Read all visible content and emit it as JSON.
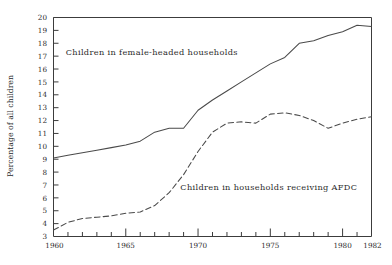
{
  "chart_data": {
    "type": "line",
    "title": "",
    "subtitle": "",
    "xlabel": "",
    "ylabel": "Percentage of all children",
    "xlim": [
      1960,
      1982
    ],
    "ylim": [
      3,
      20
    ],
    "grid": false,
    "legend_position": "inline-annotation",
    "x_tick_labels": [
      "1960",
      "1965",
      "1970",
      "1975",
      "1980",
      "1982"
    ],
    "x_tick_values": [
      1960,
      1965,
      1970,
      1975,
      1980,
      1982
    ],
    "x_minor_tick_values": [
      1961,
      1962,
      1963,
      1964,
      1966,
      1967,
      1968,
      1969,
      1971,
      1972,
      1973,
      1974,
      1976,
      1977,
      1978,
      1979,
      1981
    ],
    "y_tick_labels": [
      "3",
      "4",
      "5",
      "6",
      "7",
      "8",
      "9",
      "10",
      "11",
      "12",
      "13",
      "14",
      "15",
      "16",
      "17",
      "18",
      "19",
      "20"
    ],
    "y_tick_values": [
      3,
      4,
      5,
      6,
      7,
      8,
      9,
      10,
      11,
      12,
      13,
      14,
      15,
      16,
      17,
      18,
      19,
      20
    ],
    "x": [
      1960,
      1961,
      1962,
      1963,
      1964,
      1965,
      1966,
      1967,
      1968,
      1969,
      1970,
      1971,
      1972,
      1973,
      1974,
      1975,
      1976,
      1977,
      1978,
      1979,
      1980,
      1981,
      1982
    ],
    "series": [
      {
        "name": "Children in female-headed households",
        "style": "solid",
        "color": "#4a4a4a",
        "annotation": "Children in female-headed households",
        "values": [
          9.1,
          9.3,
          9.5,
          9.7,
          9.9,
          10.1,
          10.4,
          11.1,
          11.4,
          11.4,
          12.8,
          13.6,
          14.3,
          15.0,
          15.7,
          16.4,
          16.9,
          18.0,
          18.2,
          18.6,
          18.9,
          19.4,
          19.3
        ]
      },
      {
        "name": "Children in households receiving AFDC",
        "style": "dashed",
        "color": "#4a4a4a",
        "annotation": "Children in households receiving AFDC",
        "values": [
          3.5,
          4.1,
          4.4,
          4.5,
          4.6,
          4.8,
          4.9,
          5.4,
          6.4,
          7.8,
          9.6,
          11.1,
          11.8,
          11.9,
          11.8,
          12.5,
          12.6,
          12.4,
          12.0,
          11.4,
          11.8,
          12.1,
          12.3
        ]
      }
    ],
    "annotations": [
      {
        "text": "Children in female-headed households",
        "x": 1966.8,
        "y": 17.1,
        "anchor": "middle"
      },
      {
        "text": "Children in households receiving AFDC",
        "x": 1974.9,
        "y": 6.6,
        "anchor": "middle"
      }
    ]
  }
}
